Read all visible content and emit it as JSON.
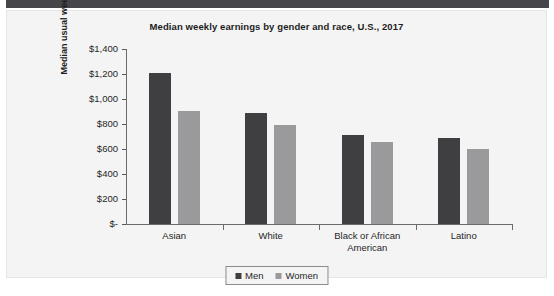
{
  "panel": {
    "top_band_color": "#46464a",
    "background_color": "#f4f4f4"
  },
  "chart_data": {
    "type": "bar",
    "title": "Median weekly earnings by gender and race, U.S., 2017",
    "xlabel": "",
    "ylabel": "Median usual weekly earnings",
    "categories": [
      "Asian",
      "White",
      "Black or African American",
      "Latino"
    ],
    "series": [
      {
        "name": "Men",
        "color": "#3f3f41",
        "values": [
          1207,
          890,
          710,
          690
        ]
      },
      {
        "name": "Women",
        "color": "#9a9a9c",
        "values": [
          903,
          795,
          655,
          603
        ]
      }
    ],
    "ylim": [
      0,
      1400
    ],
    "ytick_values": [
      1400,
      1200,
      1000,
      800,
      600,
      400,
      200,
      0
    ],
    "ytick_labels": [
      "$1,400",
      "$1,200",
      "$1,000",
      "$800",
      "$600",
      "$400",
      "$200",
      "$-"
    ],
    "grid": false,
    "legend_position": "bottom"
  }
}
